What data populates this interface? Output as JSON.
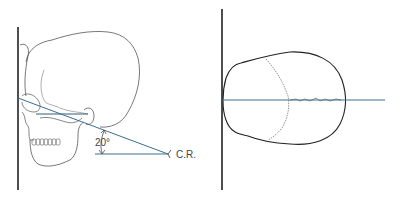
{
  "figure": {
    "panels": [
      {
        "id": "lateral-view",
        "description": "Lateral skull with central ray angled 20 degrees",
        "angle_label": "20°",
        "ray_label": "C.R."
      },
      {
        "id": "axial-view",
        "description": "Top-down (vertex) skull outline with horizontal central line"
      }
    ],
    "colors": {
      "outline": "#333333",
      "ray": "#3a6f8f",
      "film": "#222222"
    }
  }
}
